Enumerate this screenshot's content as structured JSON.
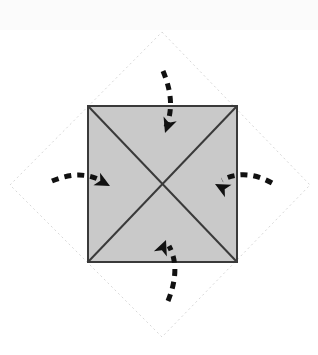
{
  "figure": {
    "title": "Square folded inward along diagonals",
    "canvas": {
      "width": 318,
      "height": 355,
      "background": "#ffffff"
    },
    "top_band": {
      "color": "#fbfbfb",
      "height": 30
    },
    "shapes": {
      "outer_diamond": {
        "name": "dashed-diamond-outline",
        "stroke": "#d8d8d8",
        "stroke_width": 1,
        "dash": "2 3",
        "fill": "none",
        "points": [
          {
            "x": 162,
            "y": 32
          },
          {
            "x": 310,
            "y": 185
          },
          {
            "x": 162,
            "y": 337
          },
          {
            "x": 10,
            "y": 185
          }
        ]
      },
      "inner_square": {
        "name": "shaded-square",
        "stroke": "#3a3a3a",
        "stroke_width": 2,
        "fill": "#c9c9c9",
        "points": [
          {
            "x": 88,
            "y": 106
          },
          {
            "x": 237,
            "y": 106
          },
          {
            "x": 237,
            "y": 262
          },
          {
            "x": 88,
            "y": 262
          }
        ]
      },
      "diagonals": {
        "name": "square-diagonals",
        "stroke": "#3a3a3a",
        "stroke_width": 2,
        "lines": [
          {
            "x1": 88,
            "y1": 106,
            "x2": 237,
            "y2": 262
          },
          {
            "x1": 237,
            "y1": 106,
            "x2": 88,
            "y2": 262
          }
        ],
        "intersection": {
          "x": 163,
          "y": 184
        }
      }
    },
    "arrows": {
      "stroke": "#111111",
      "stroke_width": 5,
      "dash": "7 6",
      "items": [
        {
          "id": "arrow-top",
          "label": "fold-arrow-top",
          "direction": "down",
          "path": "M 163 71 C 173 95 172 112 166 127",
          "head": {
            "x": 165,
            "y": 133,
            "angle": 110
          }
        },
        {
          "id": "arrow-left",
          "label": "fold-arrow-left",
          "direction": "right",
          "path": "M 52 181 C 74 172 90 174 104 182",
          "head": {
            "x": 110,
            "y": 186,
            "angle": 28
          }
        },
        {
          "id": "arrow-right",
          "label": "fold-arrow-right",
          "direction": "left",
          "path": "M 272 183 C 252 172 236 173 222 180",
          "head": {
            "x": 215,
            "y": 184,
            "angle": 208
          }
        },
        {
          "id": "arrow-bottom",
          "label": "fold-arrow-bottom",
          "direction": "up",
          "path": "M 168 301 C 178 276 176 259 169 246",
          "head": {
            "x": 166,
            "y": 240,
            "angle": 292
          }
        }
      ]
    },
    "colors": {
      "square_fill": "#c9c9c9",
      "square_stroke": "#3a3a3a",
      "diamond_stroke": "#d8d8d8",
      "arrow_color": "#111111",
      "background": "#ffffff"
    }
  }
}
